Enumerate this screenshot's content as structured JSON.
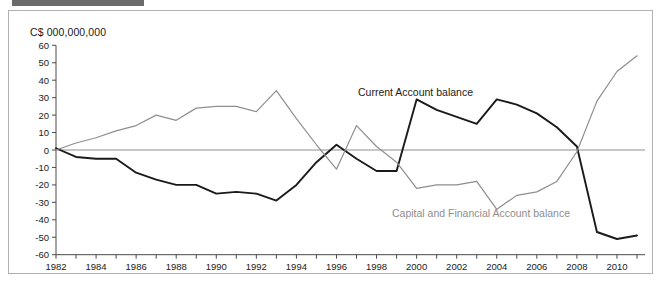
{
  "figure": {
    "unit_label": "C$ 000,000,000",
    "header_bar_color": "#6b6b6b",
    "frame_color": "#b0b0b0",
    "background": "#ffffff"
  },
  "chart_data": {
    "type": "line",
    "title": "",
    "subtitle": "",
    "xlabel": "",
    "ylabel": "C$ 000,000,000",
    "ylim": [
      -60,
      60
    ],
    "xlim": [
      1982,
      2011
    ],
    "yticks": [
      60,
      50,
      40,
      30,
      20,
      10,
      0,
      -10,
      -20,
      -30,
      -40,
      -50,
      -60
    ],
    "ytick_labels": [
      "60",
      "50",
      "40",
      "30",
      "20",
      "10",
      "0",
      "-10",
      "-20",
      "-30",
      "-40",
      "-50",
      "-60"
    ],
    "x": [
      1982,
      1983,
      1984,
      1985,
      1986,
      1987,
      1988,
      1989,
      1990,
      1991,
      1992,
      1993,
      1994,
      1995,
      1996,
      1997,
      1998,
      1999,
      2000,
      2001,
      2002,
      2003,
      2004,
      2005,
      2006,
      2007,
      2008,
      2009,
      2010,
      2011
    ],
    "xtick_labels": [
      "1982",
      "",
      "1984",
      "",
      "1986",
      "",
      "1988",
      "",
      "1990",
      "",
      "1992",
      "",
      "1994",
      "",
      "1996",
      "",
      "1998",
      "",
      "2000",
      "",
      "2002",
      "",
      "2004",
      "",
      "2006",
      "",
      "2008",
      "",
      "2010",
      ""
    ],
    "xticks_labeled": [
      1982,
      1984,
      1986,
      1988,
      1990,
      1992,
      1994,
      1996,
      1998,
      2000,
      2002,
      2004,
      2006,
      2008,
      2010
    ],
    "grid": false,
    "legend_position": "inline-annotation",
    "zero_line": true,
    "series": [
      {
        "name": "Current Account balance",
        "color": "#1a1a1a",
        "label_x": 2000,
        "label_y": 40,
        "values": [
          1,
          -4,
          -5,
          -5,
          -13,
          -17,
          -20,
          -20,
          -25,
          -24,
          -25,
          -29,
          -20,
          -7,
          3,
          -5,
          -12,
          -12,
          29,
          23,
          19,
          15,
          29,
          26,
          21,
          13,
          2,
          -47,
          -51,
          -49
        ]
      },
      {
        "name": "Capital and Financial Account balance",
        "color": "#8e8e8e",
        "label_x": 2003,
        "label_y": -42,
        "values": [
          0,
          4,
          7,
          11,
          14,
          20,
          17,
          24,
          25,
          25,
          22,
          34,
          18,
          3,
          -11,
          14,
          2,
          -7,
          -22,
          -20,
          -20,
          -18,
          -34,
          -26,
          -24,
          -18,
          -1,
          28,
          45,
          54
        ]
      }
    ]
  },
  "annotations": [
    {
      "text": "Current Account balance",
      "color": "#1a1a1a"
    },
    {
      "text": "Capital and Financial Account balance",
      "color": "#8e8e8e"
    }
  ]
}
